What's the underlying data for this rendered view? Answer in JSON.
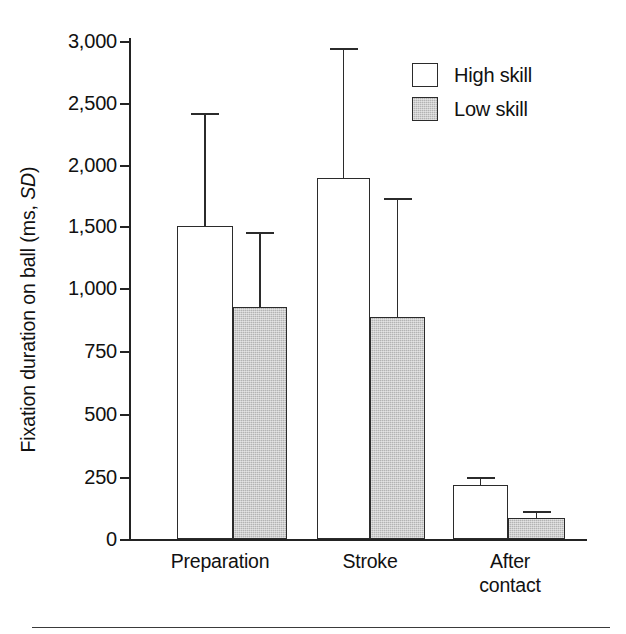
{
  "chart_data": {
    "type": "bar",
    "title": "",
    "xlabel": "",
    "ylabel": "Fixation duration on ball (ms, SD)",
    "ylabel_plain": "Fixation duration on ball (ms, ",
    "ylabel_italic": "SD",
    "ylabel_tail": ")",
    "categories": [
      "Preparation",
      "Stroke",
      "After contact"
    ],
    "category_lines": [
      [
        "Preparation"
      ],
      [
        "Stroke"
      ],
      [
        "After",
        "contact"
      ]
    ],
    "series": [
      {
        "name": "High skill",
        "fill": "white",
        "values": [
          1500,
          1900,
          217
        ],
        "errors": [
          900,
          1000,
          33
        ],
        "error_tops": [
          2400,
          2900,
          250
        ]
      },
      {
        "name": "Low skill",
        "fill": "gray",
        "values": [
          925,
          885,
          83
        ],
        "errors": [
          545,
          845,
          25
        ],
        "error_tops": [
          1470,
          1730,
          108
        ]
      }
    ],
    "ytick_labels": [
      "3,000",
      "2,500",
      "2,000",
      "1,500",
      "1,000",
      "750",
      "500",
      "250",
      "0"
    ],
    "ytick_values": [
      3000,
      2500,
      2000,
      1500,
      1000,
      750,
      500,
      250,
      0
    ],
    "ytick_pixel_y": [
      41,
      103,
      165,
      226,
      288,
      351,
      414,
      477,
      539
    ],
    "ylim": [
      0,
      3000
    ],
    "axis_note": "non-linear: 500-unit steps above 1000, 250-unit steps below 1000",
    "grid": false,
    "legend": {
      "position": "top-right",
      "entries": [
        "High skill",
        "Low skill"
      ]
    },
    "colors": {
      "high_skill_fill": "#ffffff",
      "low_skill_fill": "#b3b3b3",
      "outline": "#2b2b2b",
      "axis": "#232323",
      "text": "#111111"
    }
  },
  "geometry": {
    "bars": [
      {
        "group": 0,
        "series": 0,
        "left": 177,
        "width": 56,
        "top": 226,
        "height": 313,
        "err_top": 113,
        "err_cap_w": 28
      },
      {
        "group": 0,
        "series": 1,
        "left": 233,
        "width": 54,
        "top": 307,
        "height": 232,
        "err_top": 232,
        "err_cap_w": 28
      },
      {
        "group": 1,
        "series": 0,
        "left": 317,
        "width": 53,
        "top": 178,
        "height": 361,
        "err_top": 48,
        "err_cap_w": 28
      },
      {
        "group": 1,
        "series": 1,
        "left": 370,
        "width": 55,
        "top": 317,
        "height": 222,
        "err_top": 198,
        "err_cap_w": 28
      },
      {
        "group": 2,
        "series": 0,
        "left": 453,
        "width": 55,
        "top": 485,
        "height": 54,
        "err_top": 477,
        "err_cap_w": 28
      },
      {
        "group": 2,
        "series": 1,
        "left": 508,
        "width": 57,
        "top": 518,
        "height": 21,
        "err_top": 511,
        "err_cap_w": 28
      }
    ],
    "xlabels": [
      {
        "left": 150,
        "width": 140
      },
      {
        "left": 300,
        "width": 140
      },
      {
        "left": 440,
        "width": 140
      }
    ]
  }
}
